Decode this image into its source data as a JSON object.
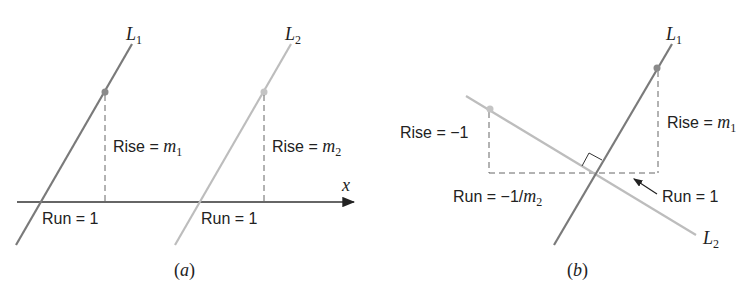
{
  "colors": {
    "line_dark": "#7a7a7a",
    "line_light": "#bdbdbd",
    "axis": "#333333",
    "dashed": "#666666",
    "text": "#222222"
  },
  "panel_a": {
    "caption_open": "(",
    "caption_letter": "a",
    "caption_close": ")",
    "axis_label": "x",
    "line1": {
      "name": "L",
      "sub": "1"
    },
    "line2": {
      "name": "L",
      "sub": "2"
    },
    "rise1": {
      "text": "Rise = ",
      "var": "m",
      "sub": "1"
    },
    "rise2": {
      "text": "Rise = ",
      "var": "m",
      "sub": "2"
    },
    "run1": "Run = 1",
    "run2": "Run = 1"
  },
  "panel_b": {
    "caption_open": "(",
    "caption_letter": "b",
    "caption_close": ")",
    "line1": {
      "name": "L",
      "sub": "1"
    },
    "line2": {
      "name": "L",
      "sub": "2"
    },
    "rise_left": "Rise = −1",
    "rise_right": {
      "text": "Rise = ",
      "var": "m",
      "sub": "1"
    },
    "run_left": {
      "text": "Run = −1/",
      "var": "m",
      "sub": "2"
    },
    "run_right": "Run = 1"
  }
}
